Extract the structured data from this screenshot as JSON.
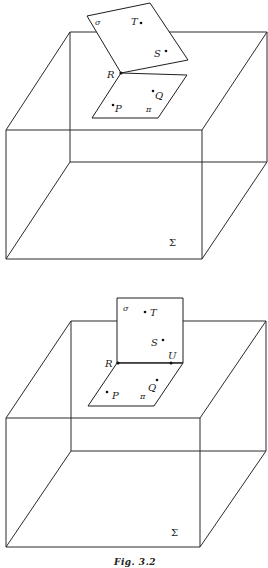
{
  "figure": {
    "caption": "Fig. 3.2",
    "panels": [
      {
        "id": "top",
        "space_label": "Σ",
        "plane_sigma_label": "σ",
        "plane_pi_label": "π",
        "points": {
          "T": "T",
          "S": "S",
          "R": "R",
          "Q": "Q",
          "P": "P"
        }
      },
      {
        "id": "bottom",
        "space_label": "Σ",
        "plane_sigma_label": "σ",
        "plane_pi_label": "π",
        "points": {
          "T": "T",
          "S": "S",
          "R": "R",
          "U": "U",
          "Q": "Q",
          "P": "P"
        }
      }
    ]
  }
}
